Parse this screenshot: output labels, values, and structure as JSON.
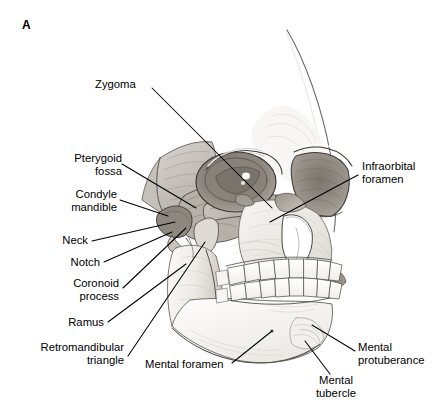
{
  "figure": {
    "panel_letter": "A",
    "view": "oblique three-quarter view of human skull",
    "style": "grayscale pencil / graphite anatomical illustration",
    "background_color": "#ffffff",
    "ink_color": "#000000"
  },
  "labels": [
    {
      "id": "zygoma",
      "text": "Zygoma",
      "align": "left",
      "x": 95,
      "y": 78,
      "leader": [
        [
          152,
          88
        ],
        [
          272,
          208
        ]
      ]
    },
    {
      "id": "pterygoid-fossa",
      "text": "Pterygoid\nfossa",
      "align": "right",
      "x": 34,
      "y": 152,
      "leader": [
        [
          122,
          164
        ],
        [
          196,
          208
        ]
      ]
    },
    {
      "id": "condyle-mandible",
      "text": "Condyle\nmandible",
      "align": "right",
      "x": 29,
      "y": 188,
      "leader": [
        [
          120,
          200
        ],
        [
          168,
          216
        ]
      ]
    },
    {
      "id": "neck",
      "text": "Neck",
      "align": "right",
      "x": 52,
      "y": 236,
      "leader": [
        [
          92,
          241
        ],
        [
          175,
          222
        ]
      ]
    },
    {
      "id": "notch",
      "text": "Notch",
      "align": "right",
      "x": 62,
      "y": 258,
      "leader": [
        [
          104,
          262
        ],
        [
          172,
          232
        ]
      ]
    },
    {
      "id": "coronoid-process",
      "text": "Coronoid\nprocess",
      "align": "right",
      "x": 32,
      "y": 278,
      "leader": [
        [
          123,
          288
        ],
        [
          186,
          228
        ]
      ]
    },
    {
      "id": "ramus",
      "text": "Ramus",
      "align": "right",
      "x": 60,
      "y": 319,
      "leader": [
        [
          108,
          322
        ],
        [
          186,
          264
        ]
      ]
    },
    {
      "id": "retromandibular-triangle",
      "text": "Retromandibular\ntriangle",
      "align": "right",
      "x": 30,
      "y": 344,
      "leader": [
        [
          128,
          356
        ],
        [
          205,
          242
        ]
      ]
    },
    {
      "id": "mental-foramen",
      "text": "Mental foramen",
      "align": "left",
      "x": 145,
      "y": 364,
      "leader": [
        [
          232,
          363
        ],
        [
          272,
          331
        ]
      ]
    },
    {
      "id": "infraorbital-foramen",
      "text": "Infraorbital\nforamen",
      "align": "left",
      "x": 362,
      "y": 160,
      "leader": [
        [
          358,
          175
        ],
        [
          270,
          222
        ]
      ]
    },
    {
      "id": "mental-protuberance",
      "text": "Mental\nprotuberance",
      "align": "left",
      "x": 358,
      "y": 345,
      "leader": [
        [
          355,
          351
        ],
        [
          312,
          325
        ]
      ]
    },
    {
      "id": "mental-tubercle",
      "text": "Mental\ntubercle",
      "align": "center",
      "x": 316,
      "y": 377,
      "leader": [
        [
          330,
          374
        ],
        [
          305,
          341
        ]
      ]
    }
  ],
  "anatomy_points": [
    {
      "name": "mental-foramen-dot",
      "x": 272,
      "y": 331
    },
    {
      "name": "infraorbital-foramen-target",
      "x": 270,
      "y": 222
    }
  ]
}
